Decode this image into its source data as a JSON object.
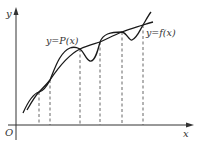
{
  "diagram": {
    "title": "",
    "axes": {
      "x_label": "x",
      "y_label": "y",
      "origin_label": "O"
    },
    "curves": [
      {
        "id": "f",
        "label": "y=f(x)",
        "style": "solid"
      },
      {
        "id": "P",
        "label": "y=P(x)",
        "style": "solid"
      }
    ],
    "intersection_count": 6,
    "dashed_guides": "vertical dashed lines from each intersection point down to the x-axis",
    "colors": {
      "stroke": "#1a1a1a",
      "dashed": "#555555",
      "text": "#333333"
    }
  }
}
